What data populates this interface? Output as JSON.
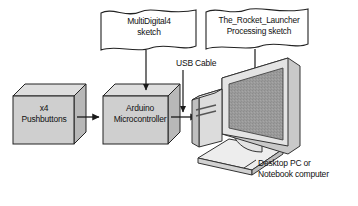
{
  "diagram": {
    "nodes": {
      "pushbuttons": {
        "line1": "x4",
        "line2": "Pushbuttons",
        "shape": "3d-box"
      },
      "arduino": {
        "line1": "Arduino",
        "line2": "Microcontroller",
        "shape": "3d-box"
      },
      "computer": {
        "shape": "desktop-computer-illustration"
      }
    },
    "banners": {
      "sketch_arduino": {
        "line1": "MultiDigital4",
        "line2": "sketch",
        "shape": "wavy-banner"
      },
      "sketch_processing": {
        "line1": "The_Rocket_Launcher",
        "line2": "Processing sketch",
        "shape": "wavy-banner"
      }
    },
    "labels": {
      "usb_cable": "USB Cable",
      "computer_caption_line1": "Desktop PC or",
      "computer_caption_line2": "Notebook computer"
    },
    "connections": [
      {
        "from": "pushbuttons",
        "to": "arduino",
        "type": "arrow",
        "direction": "right"
      },
      {
        "from": "arduino",
        "to": "computer",
        "type": "arrow",
        "direction": "right"
      },
      {
        "from": "sketch_arduino",
        "to": "arduino",
        "type": "arrow",
        "direction": "down"
      },
      {
        "from": "usb_cable",
        "to": "arduino-computer-link",
        "type": "arrow",
        "direction": "down"
      },
      {
        "from": "sketch_processing",
        "to": "computer",
        "type": "arrow",
        "direction": "down"
      },
      {
        "from": "computer",
        "to": "computer_caption",
        "type": "leader-line"
      }
    ],
    "colors": {
      "background": "#ffffff",
      "box_face": "#cfcfcf",
      "box_top": "#dedede",
      "box_side": "#b8b8b8",
      "screen": "#9a9a9a",
      "banner_fill": "#ffffff",
      "outline": "#222222",
      "device_light": "#e6e6e6",
      "device_mid": "#cfcfcf",
      "device_dark": "#aeaeae"
    }
  }
}
